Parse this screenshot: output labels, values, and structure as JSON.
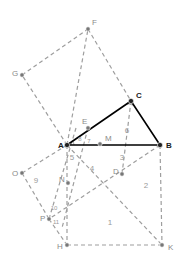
{
  "figure": {
    "canvas": {
      "width": 182,
      "height": 267
    },
    "colors": {
      "dashed_stroke": "#9e9e9e",
      "solid_stroke": "#000000",
      "point_fill": "#777777",
      "point_fill_dark": "#222222",
      "angle_arc_fill": "#a8a8a8",
      "label_dark": "#1a1a1a",
      "label_light": "#8a8a8a",
      "region_label": "#9a9a9a",
      "background": "#ffffff"
    },
    "points": [
      {
        "id": "A",
        "label": "A",
        "x": 67,
        "y": 145,
        "lx": 58,
        "ly": 148,
        "style": "dark"
      },
      {
        "id": "B",
        "label": "B",
        "x": 160,
        "y": 145,
        "lx": 166,
        "ly": 148,
        "style": "dark"
      },
      {
        "id": "C",
        "label": "C",
        "x": 131,
        "y": 101,
        "lx": 136,
        "ly": 98,
        "style": "dark"
      },
      {
        "id": "D",
        "label": "D",
        "x": 122,
        "y": 174,
        "lx": 113,
        "ly": 174,
        "style": "light"
      },
      {
        "id": "E",
        "label": "E",
        "x": 88,
        "y": 128,
        "lx": 82,
        "ly": 124,
        "style": "light"
      },
      {
        "id": "F",
        "label": "F",
        "x": 88,
        "y": 29,
        "lx": 92,
        "ly": 25,
        "style": "light"
      },
      {
        "id": "G",
        "label": "G",
        "x": 22,
        "y": 75,
        "lx": 12,
        "ly": 76,
        "style": "light"
      },
      {
        "id": "H",
        "label": "H",
        "x": 67,
        "y": 245,
        "lx": 57,
        "ly": 249,
        "style": "light"
      },
      {
        "id": "K",
        "label": "K",
        "x": 162,
        "y": 245,
        "lx": 168,
        "ly": 250,
        "style": "light"
      },
      {
        "id": "M",
        "label": "M",
        "x": 100,
        "y": 144,
        "lx": 105,
        "ly": 141,
        "style": "light"
      },
      {
        "id": "N",
        "label": "N",
        "x": 68,
        "y": 183,
        "lx": 59,
        "ly": 182,
        "style": "light"
      },
      {
        "id": "O",
        "label": "O",
        "x": 22,
        "y": 173,
        "lx": 12,
        "ly": 176,
        "style": "light"
      },
      {
        "id": "P",
        "label": "P",
        "x": 49,
        "y": 219,
        "lx": 40,
        "ly": 221,
        "style": "light"
      }
    ],
    "solid_edges": [
      {
        "id": "AB",
        "from": "A",
        "to": "B"
      },
      {
        "id": "AC",
        "from": "A",
        "to": "C"
      },
      {
        "id": "CB",
        "from": "C",
        "to": "B"
      }
    ],
    "dashed_edges": [
      {
        "id": "A-G",
        "x1": 67,
        "y1": 145,
        "x2": 22,
        "y2": 75
      },
      {
        "id": "G-F",
        "x1": 22,
        "y1": 75,
        "x2": 88,
        "y2": 29
      },
      {
        "id": "F-C",
        "x1": 88,
        "y1": 29,
        "x2": 131,
        "y2": 101
      },
      {
        "id": "A-O",
        "x1": 67,
        "y1": 145,
        "x2": 22,
        "y2": 173
      },
      {
        "id": "O-P",
        "x1": 22,
        "y1": 173,
        "x2": 49,
        "y2": 219
      },
      {
        "id": "P-H",
        "x1": 49,
        "y1": 219,
        "x2": 67,
        "y2": 245
      },
      {
        "id": "A-H",
        "x1": 67,
        "y1": 145,
        "x2": 67,
        "y2": 245
      },
      {
        "id": "H-K",
        "x1": 67,
        "y1": 245,
        "x2": 162,
        "y2": 245
      },
      {
        "id": "B-K",
        "x1": 160,
        "y1": 145,
        "x2": 162,
        "y2": 245
      },
      {
        "id": "A-D-K",
        "x1": 67,
        "y1": 145,
        "x2": 162,
        "y2": 245
      },
      {
        "id": "B-D-P",
        "x1": 160,
        "y1": 145,
        "x2": 49,
        "y2": 219
      },
      {
        "id": "E-N",
        "x1": 88,
        "y1": 128,
        "x2": 62,
        "y2": 228
      },
      {
        "id": "C-M-D",
        "x1": 131,
        "y1": 101,
        "x2": 122,
        "y2": 174
      },
      {
        "id": "A-E-F",
        "x1": 67,
        "y1": 145,
        "x2": 88,
        "y2": 29
      },
      {
        "id": "P-N-up",
        "x1": 49,
        "y1": 219,
        "x2": 76,
        "y2": 128
      }
    ],
    "angle_marks": [
      {
        "id": "angle-C",
        "at": "C",
        "cx": 131,
        "cy": 101,
        "r": 9
      },
      {
        "id": "angle-A",
        "at": "A",
        "cx": 67,
        "cy": 145,
        "r": 7
      }
    ],
    "region_labels": [
      {
        "id": "region-1",
        "text": "1",
        "x": 110,
        "y": 225,
        "size": "normal"
      },
      {
        "id": "region-2",
        "text": "2",
        "x": 146,
        "y": 188,
        "size": "normal"
      },
      {
        "id": "region-3",
        "text": "3",
        "x": 122,
        "y": 160,
        "size": "normal"
      },
      {
        "id": "region-4",
        "text": "4",
        "x": 92,
        "y": 171,
        "size": "normal"
      },
      {
        "id": "region-5",
        "text": "5",
        "x": 72,
        "y": 160,
        "size": "normal"
      },
      {
        "id": "region-6",
        "text": "6",
        "x": 127,
        "y": 133,
        "size": "normal"
      },
      {
        "id": "region-7",
        "text": "7",
        "x": 89,
        "y": 143,
        "size": "small"
      },
      {
        "id": "region-8",
        "text": "8",
        "x": 80,
        "y": 141,
        "size": "small"
      },
      {
        "id": "region-9",
        "text": "9",
        "x": 36,
        "y": 183,
        "size": "normal"
      },
      {
        "id": "region-10",
        "text": "10",
        "x": 54,
        "y": 210,
        "size": "small"
      },
      {
        "id": "region-11",
        "text": "11",
        "x": 56,
        "y": 224,
        "size": "small"
      }
    ]
  }
}
